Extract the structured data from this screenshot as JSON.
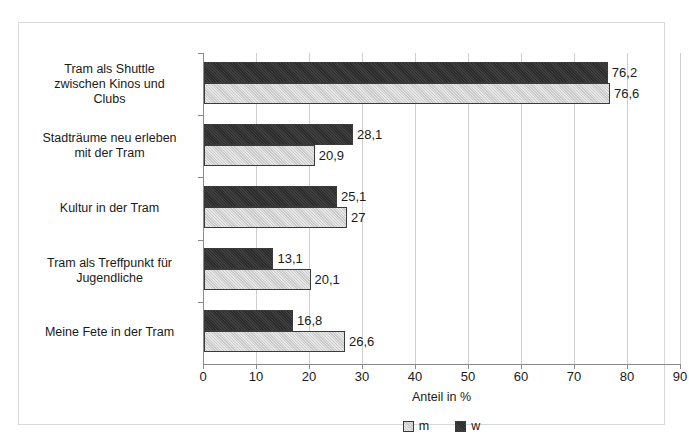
{
  "chart_data": {
    "type": "bar",
    "orientation": "horizontal",
    "title": "",
    "xlabel": "Anteil in %",
    "ylabel": "",
    "xlim": [
      0,
      90
    ],
    "xticks": [
      0,
      10,
      20,
      30,
      40,
      50,
      60,
      70,
      80,
      90
    ],
    "xtick_labels": [
      "0",
      "10",
      "20",
      "30",
      "40",
      "50",
      "60",
      "70",
      "80",
      "90"
    ],
    "grid": true,
    "legend_position": "bottom",
    "categories": [
      "Tram als Shuttle zwischen Kinos und Clubs",
      "Stadträume neu erleben mit der Tram",
      "Kultur in der Tram",
      "Tram als Treffpunkt für Jugendliche",
      "Meine Fete in der Tram"
    ],
    "category_lines": [
      [
        "Tram als Shuttle",
        "zwischen Kinos und",
        "Clubs"
      ],
      [
        "Stadträume neu erleben",
        "mit der Tram"
      ],
      [
        "Kultur in der Tram"
      ],
      [
        "Tram als Treffpunkt für",
        "Jugendliche"
      ],
      [
        "Meine Fete in der Tram"
      ]
    ],
    "series": [
      {
        "name": "w",
        "color": "#2b2b2b",
        "values": [
          76.2,
          28.1,
          25.1,
          13.1,
          16.8
        ],
        "value_labels": [
          "76,2",
          "28,1",
          "25,1",
          "13,1",
          "16,8"
        ]
      },
      {
        "name": "m",
        "color": "#c9c9c9",
        "values": [
          76.6,
          20.9,
          27.0,
          20.1,
          26.6
        ],
        "value_labels": [
          "76,6",
          "20,9",
          "27",
          "20,1",
          "26,6"
        ]
      }
    ]
  },
  "legend": {
    "items": [
      {
        "label": "m",
        "swatch": "light-gray-square"
      },
      {
        "label": "w",
        "swatch": "dark-square"
      }
    ]
  }
}
